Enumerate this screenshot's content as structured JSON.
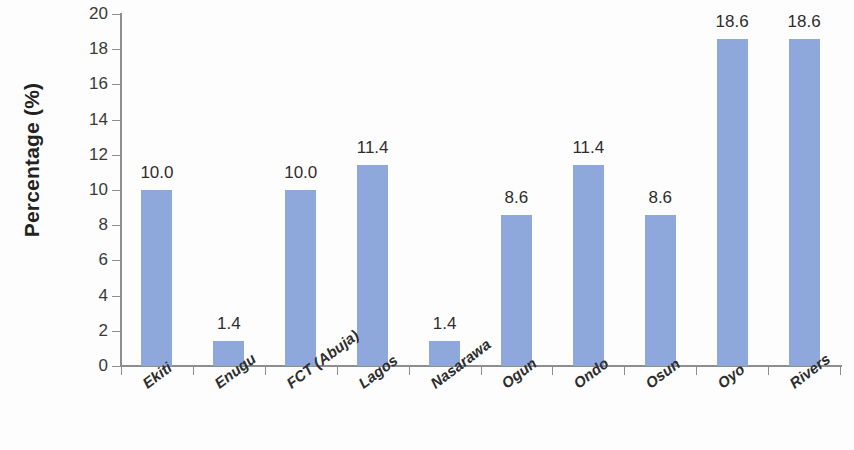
{
  "chart_data": {
    "type": "bar",
    "title": "",
    "xlabel": "",
    "ylabel": "Percentage (%)",
    "ylim": [
      0,
      20
    ],
    "ytick_step": 2,
    "yticks": [
      0,
      2,
      4,
      6,
      8,
      10,
      12,
      14,
      16,
      18,
      20
    ],
    "grid": false,
    "legend": false,
    "bar_color": "#8fa8dc",
    "axis_color": "#8e8e8e",
    "categories": [
      "Ekiti",
      "Enugu",
      "FCT (Abuja)",
      "Lagos",
      "Nasarawa",
      "Ogun",
      "Ondo",
      "Osun",
      "Oyo",
      "Rivers"
    ],
    "values": [
      10.0,
      1.4,
      10.0,
      11.4,
      1.4,
      8.6,
      11.4,
      8.6,
      18.6,
      18.6
    ],
    "value_labels": [
      "10.0",
      "1.4",
      "10.0",
      "11.4",
      "1.4",
      "8.6",
      "11.4",
      "8.6",
      "18.6",
      "18.6"
    ]
  }
}
